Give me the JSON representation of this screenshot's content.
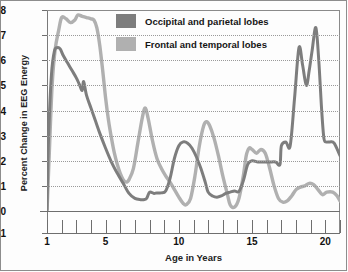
{
  "chart_data": {
    "type": "line",
    "title": "",
    "xlabel": "Age in Years",
    "ylabel": "Percent Change in EEG Energy",
    "xlim": [
      1,
      21
    ],
    "ylim": [
      -1,
      8
    ],
    "yticks": [
      -1,
      0,
      1,
      2,
      3,
      4,
      5,
      6,
      7,
      8
    ],
    "ytick_labels": [
      "-1",
      "0",
      "1",
      "2",
      "3",
      "4",
      "5",
      "6",
      "7",
      "8"
    ],
    "xticks_major": [
      1,
      5,
      10,
      15,
      20
    ],
    "xtick_labels": [
      "1",
      "5",
      "10",
      "15",
      "20"
    ],
    "xticks_minor": [
      1,
      2,
      3,
      4,
      5,
      6,
      7,
      8,
      9,
      10,
      11,
      12,
      13,
      14,
      15,
      16,
      17,
      18,
      19,
      20,
      21
    ],
    "grid": "horizontal-dotted",
    "legend_position": "top-center",
    "series": [
      {
        "name": "Occipital and parietal lobes",
        "color": "#7d7d7d",
        "x": [
          1.0,
          1.1,
          1.3,
          1.5,
          1.7,
          1.9,
          2.1,
          2.4,
          2.7,
          3.0,
          3.2,
          3.4,
          3.5,
          3.7,
          4.0,
          4.3,
          4.6,
          5.0,
          5.4,
          5.8,
          6.2,
          6.6,
          7.0,
          7.4,
          7.6,
          7.8,
          8.0,
          8.3,
          8.5,
          8.8,
          9.1,
          9.4,
          9.7,
          10.0,
          10.3,
          10.6,
          10.9,
          11.2,
          11.5,
          11.8,
          12.0,
          12.3,
          12.6,
          12.9,
          13.2,
          13.5,
          13.8,
          14.1,
          14.4,
          14.7,
          15.0,
          15.4,
          15.8,
          16.2,
          16.6,
          16.9,
          17.1,
          17.4,
          17.6,
          17.9,
          18.1,
          18.3,
          18.6,
          18.8,
          19.0,
          19.2,
          19.4,
          19.6,
          19.8,
          20.0,
          20.4,
          20.8,
          21.0
        ],
        "y": [
          0.05,
          2.8,
          5.4,
          6.35,
          6.5,
          6.45,
          6.2,
          5.9,
          5.6,
          5.3,
          5.05,
          4.8,
          5.15,
          4.6,
          4.1,
          3.6,
          3.1,
          2.5,
          1.95,
          1.5,
          1.1,
          0.7,
          0.5,
          0.45,
          0.45,
          0.5,
          0.75,
          0.7,
          0.72,
          0.72,
          0.8,
          1.3,
          2.1,
          2.6,
          2.75,
          2.7,
          2.5,
          2.15,
          1.7,
          1.15,
          0.75,
          0.6,
          0.55,
          0.6,
          0.7,
          0.75,
          0.8,
          0.78,
          1.2,
          1.85,
          2.0,
          1.95,
          1.95,
          1.95,
          1.95,
          1.85,
          1.7,
          1.85,
          2.0,
          1.95,
          1.6,
          1.7,
          1.95,
          1.95,
          1.95,
          1.9,
          1.9,
          1.9,
          1.85,
          1.6,
          1.25,
          1.9,
          2.6
        ],
        "y_late": [
          2.6,
          2.75,
          2.6,
          4.5,
          6.5,
          5.8,
          5.0,
          5.6,
          6.4,
          7.3,
          6.0,
          4.0,
          2.9,
          2.75,
          2.75,
          2.7,
          2.2
        ]
      },
      {
        "name": "Frontal and temporal lobes",
        "color": "#b0b0b0",
        "x": [
          1.0,
          1.15,
          1.35,
          1.55,
          1.8,
          2.0,
          2.3,
          2.6,
          2.9,
          3.1,
          3.4,
          3.7,
          4.0,
          4.2,
          4.4,
          4.6,
          4.8,
          5.0,
          5.2,
          5.4,
          5.6,
          5.8,
          6.0,
          6.2,
          6.4,
          6.6,
          6.9,
          7.2,
          7.5,
          7.7,
          7.9,
          8.2,
          8.5,
          8.8,
          9.1,
          9.4,
          9.7,
          10.0,
          10.3,
          10.5,
          10.8,
          11.1,
          11.4,
          11.7,
          11.9,
          12.1,
          12.4,
          12.7,
          13.0,
          13.3,
          13.5,
          13.8,
          14.1,
          14.4,
          14.6,
          14.8,
          15.0,
          15.3,
          15.6,
          15.9,
          16.2,
          16.5,
          16.8,
          17.1,
          17.4,
          17.7,
          18.0,
          18.3,
          18.6,
          18.9,
          19.2,
          19.5,
          19.8,
          20.1,
          20.5,
          20.8,
          21.0
        ],
        "y": [
          -0.05,
          2.2,
          5.0,
          6.4,
          7.2,
          7.7,
          7.65,
          7.5,
          7.6,
          7.8,
          7.75,
          7.7,
          7.65,
          7.6,
          7.3,
          6.6,
          5.6,
          4.5,
          3.6,
          2.9,
          2.3,
          1.85,
          1.5,
          1.25,
          1.15,
          1.25,
          1.7,
          2.7,
          3.7,
          4.1,
          3.7,
          2.8,
          2.1,
          1.7,
          1.4,
          1.15,
          0.85,
          0.55,
          0.3,
          0.25,
          0.5,
          1.4,
          2.6,
          3.4,
          3.55,
          3.4,
          2.9,
          2.2,
          1.4,
          0.7,
          0.25,
          0.15,
          0.5,
          1.4,
          2.2,
          2.5,
          2.45,
          2.3,
          2.45,
          2.3,
          1.7,
          1.0,
          0.5,
          0.35,
          0.4,
          0.6,
          0.85,
          0.95,
          1.0,
          1.1,
          1.05,
          0.85,
          0.65,
          0.75,
          0.75,
          0.6,
          0.4
        ]
      }
    ]
  },
  "legend": {
    "items": [
      {
        "label": "Occipital and parietal lobes",
        "color": "#7d7d7d"
      },
      {
        "label": "Frontal and temporal lobes",
        "color": "#b0b0b0"
      }
    ]
  },
  "axes": {
    "y_title": "Percent Change in EEG Energy",
    "x_title": "Age in Years"
  }
}
